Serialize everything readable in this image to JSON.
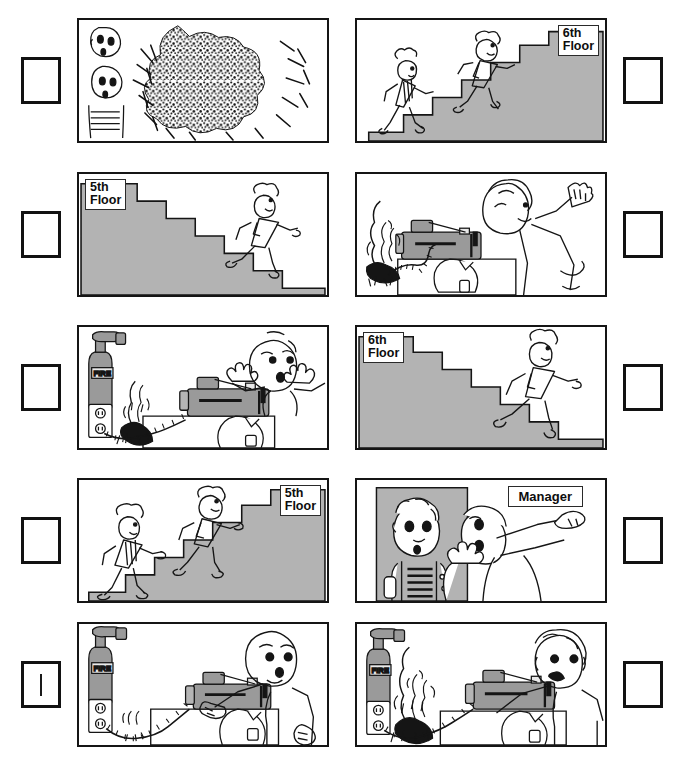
{
  "worksheet": {
    "type": "picture-sequencing-worksheet",
    "grid": {
      "rows": 5,
      "columns": 2,
      "total_panels": 10
    },
    "answer_boxes": [
      {
        "id": "box-1",
        "side": "left",
        "row": 1,
        "mark": ""
      },
      {
        "id": "box-2",
        "side": "right",
        "row": 1,
        "mark": ""
      },
      {
        "id": "box-3",
        "side": "left",
        "row": 2,
        "mark": ""
      },
      {
        "id": "box-4",
        "side": "right",
        "row": 2,
        "mark": ""
      },
      {
        "id": "box-5",
        "side": "left",
        "row": 3,
        "mark": ""
      },
      {
        "id": "box-6",
        "side": "right",
        "row": 3,
        "mark": ""
      },
      {
        "id": "box-7",
        "side": "left",
        "row": 4,
        "mark": ""
      },
      {
        "id": "box-8",
        "side": "right",
        "row": 4,
        "mark": ""
      },
      {
        "id": "box-9",
        "side": "left",
        "row": 5,
        "mark": "|"
      },
      {
        "id": "box-10",
        "side": "right",
        "row": 5,
        "mark": ""
      }
    ],
    "panels": [
      {
        "id": "panel-1",
        "row": 1,
        "column": "left",
        "scene": "two-shocked-faces-watching-large-fire",
        "labels": []
      },
      {
        "id": "panel-2",
        "row": 1,
        "column": "right",
        "scene": "two-people-running-up-stairs",
        "labels": [
          {
            "name": "floor-sign",
            "text": "6th\nFloor",
            "position": "top-right"
          }
        ]
      },
      {
        "id": "panel-3",
        "row": 2,
        "column": "left",
        "scene": "one-person-running-down-stairs",
        "labels": [
          {
            "name": "floor-sign",
            "text": "5th\nFloor",
            "position": "top-left"
          }
        ]
      },
      {
        "id": "panel-4",
        "row": 2,
        "column": "right",
        "scene": "worker-fleeing-burning-sewing-machine-outlet",
        "labels": []
      },
      {
        "id": "panel-5",
        "row": 3,
        "column": "left",
        "scene": "startled-worker-fire-at-outlet-with-extinguisher-on-wall",
        "labels": [
          {
            "name": "extinguisher-label",
            "text": "FIRE",
            "position": "on-extinguisher"
          }
        ]
      },
      {
        "id": "panel-6",
        "row": 3,
        "column": "right",
        "scene": "one-person-running-down-stairs",
        "labels": [
          {
            "name": "floor-sign",
            "text": "6th\nFloor",
            "position": "top-left"
          }
        ]
      },
      {
        "id": "panel-7",
        "row": 4,
        "column": "left",
        "scene": "two-people-walking-down-stairs",
        "labels": [
          {
            "name": "floor-sign",
            "text": "5th\nFloor",
            "position": "top-right"
          }
        ]
      },
      {
        "id": "panel-8",
        "row": 4,
        "column": "right",
        "scene": "worker-reporting-to-manager-who-points",
        "labels": [
          {
            "name": "manager-sign",
            "text": "Manager",
            "position": "top-right"
          }
        ]
      },
      {
        "id": "panel-9",
        "row": 5,
        "column": "left",
        "scene": "smiling-worker-at-sewing-machine-sparks-at-outlet",
        "labels": [
          {
            "name": "extinguisher-label",
            "text": "FIRE",
            "position": "on-extinguisher"
          }
        ]
      },
      {
        "id": "panel-10",
        "row": 5,
        "column": "right",
        "scene": "worried-worker-flames-at-outlet-near-sewing-machine",
        "labels": [
          {
            "name": "extinguisher-label",
            "text": "FIRE",
            "position": "on-extinguisher"
          }
        ]
      }
    ],
    "colors": {
      "ink": "#151515",
      "paper": "#ffffff",
      "grey_fill": "#b3b3b3",
      "grey_fill_light": "#c9c9c9",
      "grey_machine": "#9a9a9a"
    },
    "text_values": {
      "floor_6th": "6th\nFloor",
      "floor_5th": "5th\nFloor",
      "manager": "Manager",
      "fire": "FIRE",
      "tally_mark": "|"
    }
  }
}
